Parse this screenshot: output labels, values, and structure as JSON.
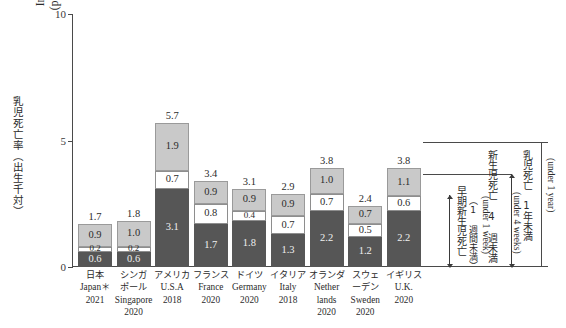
{
  "axis": {
    "y_title_jp": "乳児死亡率（出生千対）",
    "y_title_en_line1": "Infant mortality rate",
    "y_title_en_line2": "(per 1 000 live births)",
    "y_ticks": [
      "10",
      "5",
      "0"
    ],
    "y_min": 0,
    "y_max": 10
  },
  "annotations": {
    "infant": {
      "jp": "乳児死亡　1年未満",
      "en": "(under 1 year)"
    },
    "neonatal": {
      "jp": "新生児死亡 4 週未満",
      "en": "(under 4 weeks)"
    },
    "early_neonatal": {
      "jp": "早期新生児死亡",
      "jp2": "（1 週間未満）",
      "en": "(under 1 week)"
    }
  },
  "chart_data": {
    "type": "bar",
    "title": "",
    "xlabel": "",
    "ylabel": "Infant mortality rate (per 1 000 live births)",
    "ylim": [
      0,
      10
    ],
    "grid": false,
    "stacked": true,
    "legend_position": "right-brackets",
    "categories": [
      "Japan 2021",
      "Singapore 2020",
      "U.S.A 2018",
      "France 2020",
      "Germany 2020",
      "Italy 2018",
      "Netherlands 2020",
      "Sweden 2020",
      "U.K. 2020"
    ],
    "series": [
      {
        "name": "early neonatal (under 1 week)",
        "color": "#565656",
        "values": [
          0.6,
          0.6,
          3.1,
          1.7,
          1.8,
          1.3,
          2.2,
          1.2,
          2.2
        ]
      },
      {
        "name": "neonatal 1 week to under 4 weeks",
        "color": "#ffffff",
        "values": [
          0.2,
          0.2,
          0.7,
          0.8,
          0.4,
          0.7,
          0.7,
          0.5,
          0.6
        ]
      },
      {
        "name": "post-neonatal 4 weeks to under 1 year",
        "color": "#c9c9c9",
        "values": [
          0.9,
          1.0,
          1.9,
          0.9,
          0.9,
          0.9,
          1.0,
          0.7,
          1.1
        ]
      }
    ],
    "totals": [
      1.7,
      1.8,
      5.7,
      3.4,
      3.1,
      2.9,
      3.8,
      2.4,
      3.8
    ]
  },
  "x_labels": [
    {
      "jp1": "日本",
      "en": "Japan＊",
      "year": "2021"
    },
    {
      "jp1": "シンガ",
      "jp2": "ポール",
      "en": "Singapore",
      "year": "2020"
    },
    {
      "jp1": "アメリカ",
      "en": "U.S.A",
      "year": "2018"
    },
    {
      "jp1": "フランス",
      "en": "France",
      "year": "2020"
    },
    {
      "jp1": "ドイツ",
      "en": "Germany",
      "year": "2020"
    },
    {
      "jp1": "イタリア",
      "en": "Italy",
      "year": "2018"
    },
    {
      "jp1": "オランダ",
      "en": "Nether",
      "en2": "lands",
      "year": "2020"
    },
    {
      "jp1": "スウェ",
      "jp2": "ーデン",
      "en": "Sweden",
      "year": "2020"
    },
    {
      "jp1": "イギリス",
      "en": "U.K.",
      "year": "2020"
    }
  ]
}
